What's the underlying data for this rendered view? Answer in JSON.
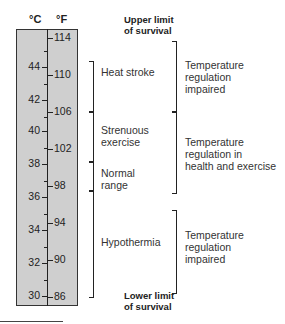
{
  "headers": {
    "celsius": "°C",
    "fahrenheit": "°F"
  },
  "scale": {
    "celsius_labels": [
      "44",
      "42",
      "40",
      "38",
      "36",
      "34",
      "32",
      "30"
    ],
    "fahrenheit_labels": [
      "114",
      "110",
      "106",
      "102",
      "98",
      "94",
      "90",
      "86"
    ]
  },
  "limits": {
    "upper": [
      "Upper limit",
      "of survival"
    ],
    "lower": [
      "Lower limit",
      "of survival"
    ]
  },
  "conditions": [
    {
      "label": [
        "Heat stroke"
      ],
      "range_f": [
        106,
        111
      ]
    },
    {
      "label": [
        "Strenuous",
        "exercise"
      ],
      "range_f": [
        100.5,
        106
      ]
    },
    {
      "label": [
        "Normal",
        "range"
      ],
      "range_f": [
        97.5,
        100.5
      ]
    },
    {
      "label": [
        "Hypothermia"
      ],
      "range_f": [
        86,
        97.5
      ]
    }
  ],
  "regulation": [
    {
      "label": [
        "Temperature",
        "regulation",
        "impaired"
      ]
    },
    {
      "label": [
        "Temperature",
        "regulation in",
        "health and exercise"
      ]
    },
    {
      "label": [
        "Temperature",
        "regulation",
        "impaired"
      ]
    }
  ],
  "colors": {
    "scale_fill": "#cfcfcf",
    "line": "#222222"
  }
}
